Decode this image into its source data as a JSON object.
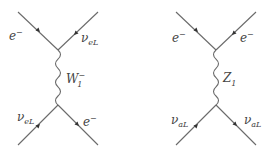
{
  "diagrams": [
    {
      "name": "W-exchange",
      "mediator": {
        "symbol": "W",
        "subscript": "1",
        "superscript": "−"
      },
      "labels": {
        "top_left": {
          "base": "e",
          "sup": "−"
        },
        "top_right": {
          "base": "ν",
          "sub": "eL"
        },
        "bottom_left": {
          "base": "ν",
          "sub": "eL"
        },
        "bottom_right": {
          "base": "e",
          "sup": "−"
        }
      }
    },
    {
      "name": "Z-exchange",
      "mediator": {
        "symbol": "Z",
        "subscript": "1"
      },
      "labels": {
        "top_left": {
          "base": "e",
          "sup": "−"
        },
        "top_right": {
          "base": "e",
          "sup": "−"
        },
        "bottom_left": {
          "base": "ν",
          "sub": "aL"
        },
        "bottom_right": {
          "base": "ν",
          "sub": "aL"
        }
      }
    }
  ],
  "colors": {
    "line": "#6a6a6a",
    "arrow": "#333333",
    "text": "#444444"
  }
}
